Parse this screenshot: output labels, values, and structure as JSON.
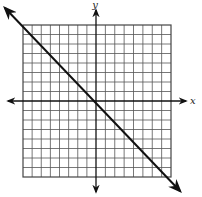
{
  "chart_data": {
    "type": "line",
    "title": "",
    "xlabel": "x",
    "ylabel": "y",
    "xlim": [
      -8,
      8
    ],
    "ylim": [
      -8,
      8
    ],
    "grid": true,
    "grid_step": 1,
    "legend": null,
    "series": [
      {
        "name": "line",
        "equation": "y = -x - 1",
        "slope": -1,
        "intercept": -1,
        "x": [
          -8,
          -7,
          0,
          7,
          8
        ],
        "y": [
          7,
          6,
          -1,
          -8,
          -9
        ],
        "arrows_both_ends": true
      }
    ]
  },
  "axes": {
    "x_label": "x",
    "y_label": "y"
  },
  "colors": {
    "grid": "#555555",
    "axis": "#111111",
    "line": "#111111",
    "background": "#ffffff"
  }
}
